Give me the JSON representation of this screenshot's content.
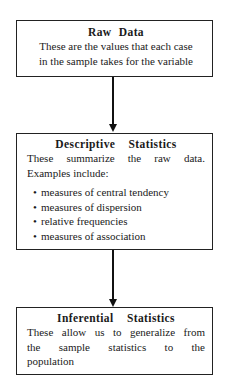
{
  "diagram": {
    "nodes": [
      {
        "id": "raw-data",
        "title": "Raw Data",
        "lines": [
          "These are the values that each case",
          "in the sample takes for the variable"
        ]
      },
      {
        "id": "descriptive-statistics",
        "title": "Descriptive Statistics",
        "lines": [
          "These summarize the raw data.",
          "Examples include:"
        ],
        "bullets": [
          "measures of central tendency",
          "measures of dispersion",
          "relative frequencies",
          "measures of association"
        ]
      },
      {
        "id": "inferential-statistics",
        "title": "Inferential Statistics",
        "lines": [
          "These allow us to generalize from",
          "the sample statistics to the",
          "population"
        ]
      }
    ],
    "edges": [
      {
        "from": "raw-data",
        "to": "descriptive-statistics"
      },
      {
        "from": "descriptive-statistics",
        "to": "inferential-statistics"
      }
    ],
    "bullet_glyph": "•"
  }
}
